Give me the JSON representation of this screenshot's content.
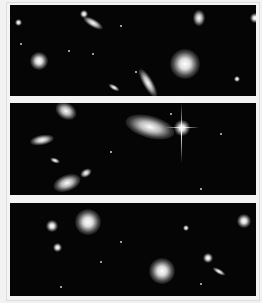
{
  "image": {
    "description": "Three stacked deep-field astronomical image panels showing galaxies and stars on a black background",
    "panels": [
      {
        "id": "panel-1",
        "top": 5,
        "height": 91
      },
      {
        "id": "panel-2",
        "top": 103,
        "height": 92
      },
      {
        "id": "panel-3",
        "top": 203,
        "height": 93
      }
    ],
    "colors": {
      "background": "#f2f2f2",
      "sky": "#050505",
      "objects": "#ffffff"
    }
  }
}
